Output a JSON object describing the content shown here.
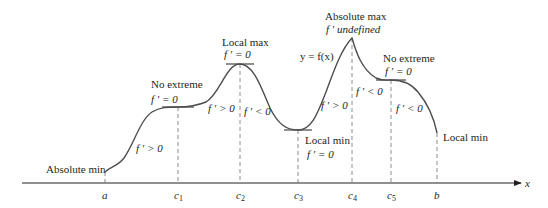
{
  "diagram": {
    "curve_label": "y = f(x)",
    "axis_label": "x",
    "ticks": [
      {
        "name": "a",
        "sub": "",
        "x": 105
      },
      {
        "name": "c",
        "sub": "1",
        "x": 178
      },
      {
        "name": "c",
        "sub": "2",
        "x": 240
      },
      {
        "name": "c",
        "sub": "3",
        "x": 298
      },
      {
        "name": "c",
        "sub": "4",
        "x": 352
      },
      {
        "name": "c",
        "sub": "5",
        "x": 391
      },
      {
        "name": "b",
        "sub": "",
        "x": 437
      }
    ],
    "annotations": {
      "abs_min": "Absolute min",
      "no_extreme_1": "No extreme",
      "no_extreme_1_deriv": "f ′ = 0",
      "incr_1": "f ′ > 0",
      "local_max": "Local max",
      "local_max_deriv": "f ′ = 0",
      "incr_2": "f ′ > 0",
      "decr_1": "f ′ < 0",
      "local_min": "Local min",
      "local_min_deriv": "f ′ = 0",
      "incr_3": "f ′ > 0",
      "abs_max": "Absolute max",
      "abs_max_deriv": "f ′  undefined",
      "decr_2": "f ′ < 0",
      "no_extreme_2": "No extreme",
      "no_extreme_2_deriv": "f ′ = 0",
      "decr_3": "f ′ < 0",
      "local_min_end": "Local min"
    },
    "colors": {
      "curve": "#4d4d4d",
      "axis": "#231f20",
      "dashed": "#6d6e71",
      "text": "#231f20"
    }
  }
}
